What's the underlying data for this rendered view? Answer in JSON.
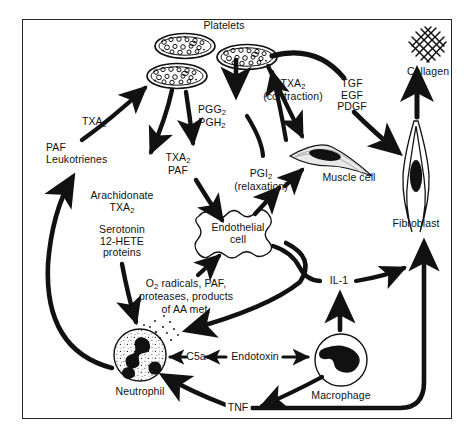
{
  "figure": {
    "type": "biological-signaling-diagram",
    "background": "#ffffff",
    "ink_color": "#111111",
    "border_color": "#262626"
  },
  "cells": [
    {
      "id": "platelet-1",
      "label": "",
      "shape": "ellipse-granular",
      "x": 185,
      "y": 46
    },
    {
      "id": "platelet-2",
      "label": "",
      "shape": "ellipse-granular",
      "x": 243,
      "y": 55
    },
    {
      "id": "platelet-3",
      "label": "",
      "shape": "ellipse-granular",
      "x": 176,
      "y": 76
    },
    {
      "id": "endothelial-cell",
      "label": "Endothelial\ncell",
      "shape": "wavy-blob",
      "x": 237,
      "y": 232
    },
    {
      "id": "muscle-cell",
      "label": "Muscle cell",
      "shape": "horizontal-spindle",
      "x": 330,
      "y": 158
    },
    {
      "id": "fibroblast",
      "label": "Fibroblast",
      "shape": "vertical-spindle",
      "x": 416,
      "y": 180
    },
    {
      "id": "neutrophil",
      "label": "Neutrophil",
      "shape": "circle-lobed-nucleus",
      "x": 140,
      "y": 355
    },
    {
      "id": "macrophage",
      "label": "Macrophage",
      "shape": "circle-bean-nucleus",
      "x": 341,
      "y": 360
    },
    {
      "id": "collagen",
      "label": "Collagen",
      "shape": "crosshatch-mesh",
      "x": 428,
      "y": 45
    }
  ],
  "labels": {
    "platelets": "Platelets",
    "collagen": "Collagen",
    "txa2_left": "TXA",
    "txa2_left_sub": "2",
    "paf_leukotrienes": "PAF\nLeukotrienes",
    "arachidonate": "Arachidonate",
    "arachidonate_txa2": "TXA",
    "arachidonate_txa2_sub": "2",
    "serotonin_block": "Serotonin\n12-HETE\nproteins",
    "pgg2": "PGG",
    "pgg2_sub": "2",
    "pgh2": "PGH",
    "pgh2_sub": "2",
    "txa2_paf_txa": "TXA",
    "txa2_paf_txa_sub": "2",
    "txa2_paf_paf": "PAF",
    "txa2_contraction": "TXA",
    "txa2_contraction_sub": "2",
    "contraction_note": "(contraction)",
    "pgi2": "PGI",
    "pgi2_sub": "2",
    "relaxation_note": "(relaxation)",
    "growth_factors": "TGF\nEGF\nPDGF",
    "muscle_cell": "Muscle cell",
    "fibroblast": "Fibroblast",
    "endothelial_cell": "Endothelial\ncell",
    "o2_radicals_line1": "O",
    "o2_radicals_sub": "2",
    "o2_radicals_line1b": " radicals, PAF,",
    "o2_radicals_line2": "proteases, products",
    "o2_radicals_line3": "of AA met.",
    "il1": "IL-1",
    "c5a": "C5a",
    "endotoxin": "Endotoxin",
    "neutrophil": "Neutrophil",
    "macrophage": "Macrophage",
    "tnf": "TNF"
  },
  "edges": [
    {
      "from": "neutrophil-region",
      "to": "platelet-3",
      "mediator": "TXA2",
      "style": "thick-curve-arrow"
    },
    {
      "from": "platelet-3",
      "to": "arachidonate",
      "mediator": "Arachidonate TXA2",
      "style": "thick-arrow"
    },
    {
      "from": "platelet-cluster",
      "to": "txa2-paf",
      "mediator": "TXA2 / PAF",
      "style": "thick-arrow"
    },
    {
      "from": "platelet-1",
      "to": "pgg2-pgh2",
      "mediator": "PGG2 / PGH2",
      "style": "thick-arrow"
    },
    {
      "from": "pgg2-pgh2",
      "to": "pgi2",
      "mediator": "PGI2",
      "style": "thick-curve"
    },
    {
      "from": "pgi2",
      "to": "muscle-cell",
      "mediator": "PGI2 (relaxation)",
      "style": "thick-arrow"
    },
    {
      "from": "platelet-2",
      "to": "muscle-cell",
      "mediator": "TXA2 (contraction)",
      "style": "thick-arrow"
    },
    {
      "from": "platelet-2",
      "to": "growth-factors",
      "mediator": "TGF EGF PDGF",
      "style": "thick-curve"
    },
    {
      "from": "growth-factors",
      "to": "fibroblast",
      "mediator": "TGF EGF PDGF",
      "style": "thick-arrow"
    },
    {
      "from": "fibroblast",
      "to": "collagen",
      "mediator": "collagen synthesis",
      "style": "thick-arrow"
    },
    {
      "from": "endothelial-cell",
      "to": "pgi2",
      "mediator": "PGI2",
      "style": "thick-arrow"
    },
    {
      "from": "txa2-paf",
      "to": "endothelial-cell",
      "mediator": "TXA2 / PAF",
      "style": "thick-arrow"
    },
    {
      "from": "neutrophil",
      "to": "endothelial-cell",
      "mediator": "O2 radicals, PAF, proteases, products of AA met.",
      "style": "thick-arrow"
    },
    {
      "from": "endothelial-cell",
      "to": "neutrophil",
      "mediator": "activation",
      "style": "thick-arrow"
    },
    {
      "from": "serotonin-block",
      "to": "neutrophil",
      "mediator": "Serotonin 12-HETE proteins",
      "style": "thick-arrow"
    },
    {
      "from": "neutrophil",
      "to": "paf-leukotrienes",
      "mediator": "PAF / Leukotrienes",
      "style": "thick-curve-arrow"
    },
    {
      "from": "endotoxin",
      "to": "c5a",
      "mediator": "Endotoxin",
      "style": "thin-arrow"
    },
    {
      "from": "c5a",
      "to": "neutrophil",
      "mediator": "C5a",
      "style": "thin-arrow"
    },
    {
      "from": "endotoxin",
      "to": "macrophage",
      "mediator": "Endotoxin",
      "style": "thin-arrow"
    },
    {
      "from": "macrophage",
      "to": "il1",
      "mediator": "IL-1",
      "style": "thick-arrow"
    },
    {
      "from": "il1",
      "to": "fibroblast",
      "mediator": "IL-1",
      "style": "thick-curve-arrow"
    },
    {
      "from": "endothelial-cell",
      "to": "il1-path",
      "mediator": "IL-1",
      "style": "thick-curve"
    },
    {
      "from": "macrophage",
      "to": "tnf",
      "mediator": "TNF",
      "style": "thick-arrow"
    },
    {
      "from": "tnf",
      "to": "neutrophil",
      "mediator": "TNF",
      "style": "thick-arrow"
    },
    {
      "from": "tnf-line",
      "to": "fibroblast",
      "mediator": "TNF",
      "style": "thick-curve"
    }
  ]
}
